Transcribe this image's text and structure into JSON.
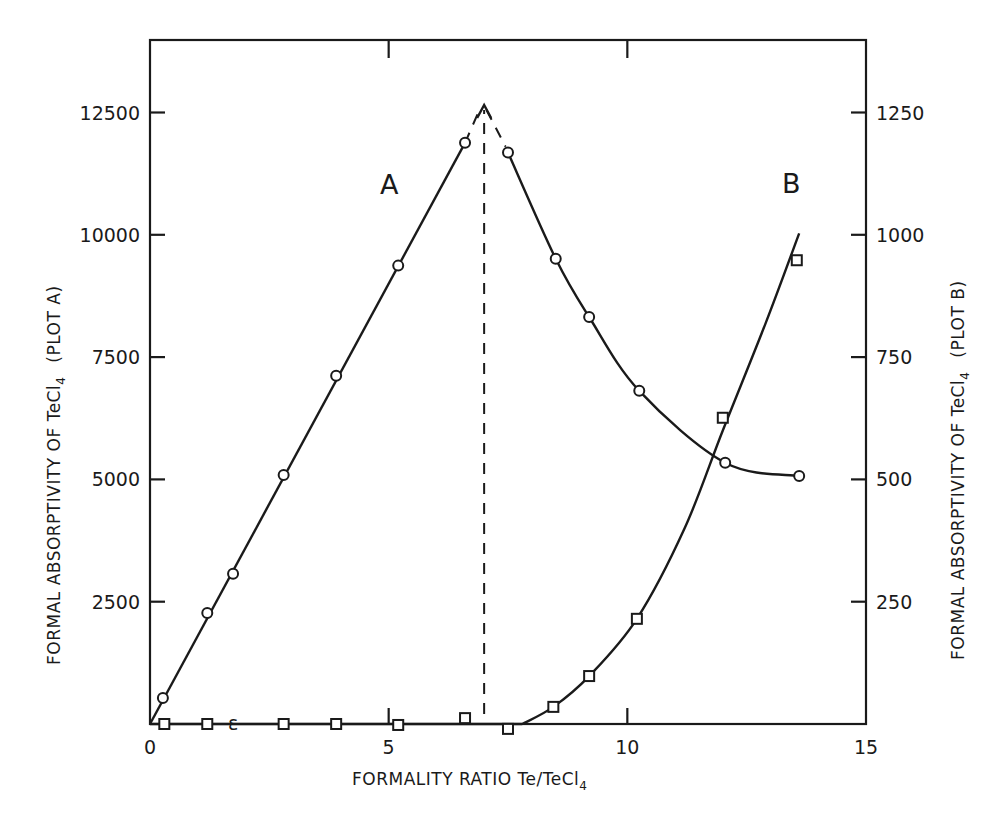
{
  "chart_data": {
    "type": "line",
    "title": "",
    "xlabel": "FORMALITY RATIO Te/TeCl4",
    "ylabel": "FORMAL ABSORPTIVITY OF TeCl4 (PLOT A)",
    "ylabel_right": "FORMAL ABSORPTIVITY OF TeCl4 (PLOT B)",
    "xlim": [
      0,
      15
    ],
    "ylim": [
      0,
      13500
    ],
    "ylim_right": [
      0,
      1350
    ],
    "grid": false,
    "legend": "none (curves labelled A and B directly)",
    "x_ticks": [
      0,
      5,
      10,
      15
    ],
    "y_ticks_left": [
      2500,
      5000,
      7500,
      10000,
      12500
    ],
    "y_ticks_right": [
      250,
      500,
      750,
      1000,
      1250
    ],
    "series": [
      {
        "name": "A",
        "axis": "left",
        "marker": "circle",
        "x": [
          0.27,
          1.2,
          1.74,
          2.8,
          3.9,
          5.2,
          6.6,
          7.5,
          8.5,
          9.2,
          10.25,
          12.05,
          13.6
        ],
        "values": [
          530,
          2270,
          3070,
          5090,
          7120,
          9370,
          11880,
          11680,
          9510,
          8320,
          6810,
          5340,
          5070
        ]
      },
      {
        "name": "B",
        "axis": "right",
        "marker": "square",
        "x": [
          0.3,
          1.2,
          2.8,
          3.9,
          5.2,
          6.6,
          7.5,
          8.45,
          9.2,
          10.2,
          12.0,
          13.55
        ],
        "values": [
          0,
          0,
          0,
          0,
          -2,
          12,
          -10,
          35,
          98,
          215,
          626,
          948
        ]
      }
    ],
    "annotations": [
      {
        "text": "A",
        "x": 4.8,
        "y": 11050
      },
      {
        "text": "B",
        "x": 13.5,
        "y": 1070
      },
      {
        "text": "dashed vertical line with arrow at x = 7.0 (intersection of extrapolated A branches)",
        "x": 7.0,
        "y": 12650
      }
    ]
  },
  "labels": {
    "x_axis_title_main": "FORMALITY  RATIO  Te/TeCl",
    "x_axis_title_sub": "4",
    "y_left_title_main": "FORMAL  ABSORPTIVITY  OF  TeCl",
    "y_left_sub": "4",
    "y_left_suffix": "(PLOT A)",
    "y_right_title_main": "FORMAL  ABSORPTIVITY  OF  TeCl",
    "y_right_sub": "4",
    "y_right_suffix": "(PLOT B)",
    "curve_a": "A",
    "curve_b": "B"
  }
}
